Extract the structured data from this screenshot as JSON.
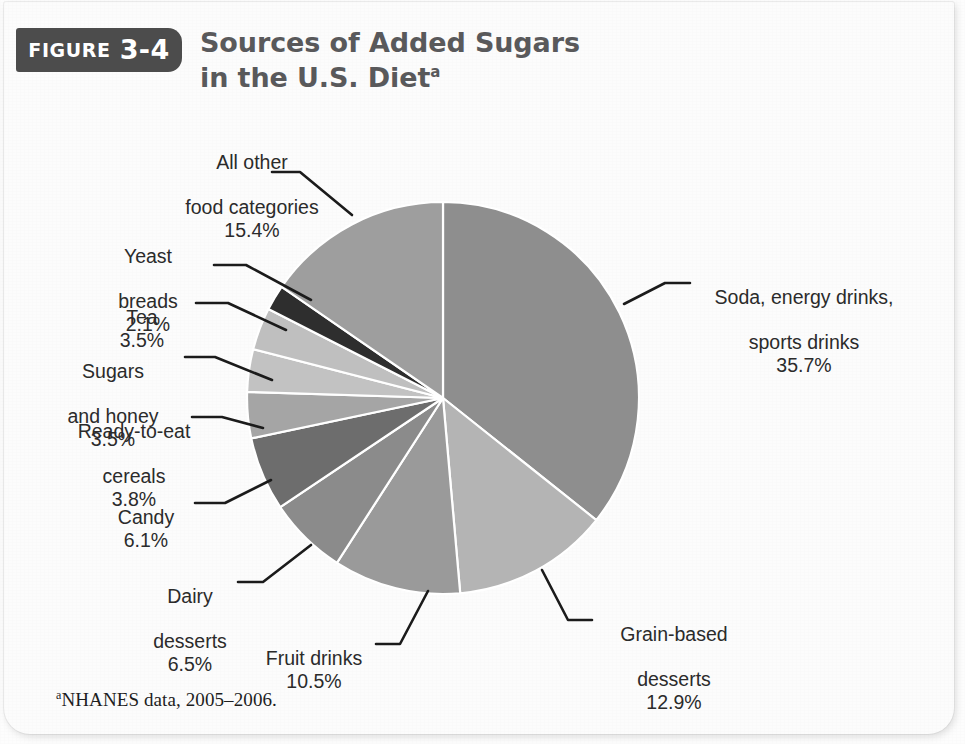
{
  "figure": {
    "badge_word": "FIGURE",
    "badge_number": "3-4",
    "title_line1": "Sources of Added Sugars",
    "title_line2": "in the U.S. Diet",
    "title_superscript": "a",
    "footnote_superscript": "a",
    "footnote_text": "NHANES data, 2005–2006."
  },
  "colors": {
    "badge_background": "#4c4c4c",
    "title_text": "#59595b",
    "label_text": "#2b2b2b",
    "leader_line": "#1b1b1b",
    "slice_border": "#ffffff",
    "page_background": "#fcfcfc"
  },
  "chart_data": {
    "type": "pie",
    "title": "Sources of Added Sugars in the U.S. Diet",
    "subtitle": "",
    "xlabel": "",
    "ylabel": "",
    "units": "percent",
    "start_angle_deg": 0,
    "direction": "clockwise",
    "legend_position": "callout-labels",
    "grid": false,
    "total": 100.0,
    "footnote": "NHANES data, 2005–2006.",
    "categories": [
      "Soda, energy drinks, sports drinks",
      "Grain-based desserts",
      "Fruit drinks",
      "Dairy desserts",
      "Candy",
      "Ready-to-eat cereals",
      "Sugars and honey",
      "Tea",
      "Yeast breads",
      "All other food categories"
    ],
    "values": [
      35.7,
      12.9,
      10.5,
      6.5,
      6.1,
      3.8,
      3.5,
      3.5,
      2.1,
      15.4
    ],
    "slices": [
      {
        "id": "soda",
        "label_line1": "Soda, energy drinks,",
        "label_line2": "sports drinks",
        "label_line3": "",
        "value": 35.7,
        "pct_text": "35.7%",
        "color": "#8e8e8e"
      },
      {
        "id": "grain",
        "label_line1": "Grain-based",
        "label_line2": "desserts",
        "label_line3": "",
        "value": 12.9,
        "pct_text": "12.9%",
        "color": "#b4b4b4"
      },
      {
        "id": "fruit",
        "label_line1": "Fruit drinks",
        "label_line2": "",
        "label_line3": "",
        "value": 10.5,
        "pct_text": "10.5%",
        "color": "#9a9a9a"
      },
      {
        "id": "dairy",
        "label_line1": "Dairy",
        "label_line2": "desserts",
        "label_line3": "",
        "value": 6.5,
        "pct_text": "6.5%",
        "color": "#8b8b8b"
      },
      {
        "id": "candy",
        "label_line1": "Candy",
        "label_line2": "",
        "label_line3": "",
        "value": 6.1,
        "pct_text": "6.1%",
        "color": "#6d6d6d"
      },
      {
        "id": "cereals",
        "label_line1": "Ready-to-eat",
        "label_line2": "cereals",
        "label_line3": "",
        "value": 3.8,
        "pct_text": "3.8%",
        "color": "#a5a5a5"
      },
      {
        "id": "sugars",
        "label_line1": "Sugars",
        "label_line2": "and honey",
        "label_line3": "",
        "value": 3.5,
        "pct_text": "3.5%",
        "color": "#c2c2c2"
      },
      {
        "id": "tea",
        "label_line1": "Tea",
        "label_line2": "",
        "label_line3": "",
        "value": 3.5,
        "pct_text": "3.5%",
        "color": "#bfbfbf"
      },
      {
        "id": "yeast",
        "label_line1": "Yeast",
        "label_line2": "breads",
        "label_line3": "",
        "value": 2.1,
        "pct_text": "2.1%",
        "color": "#2e2e2e"
      },
      {
        "id": "allother",
        "label_line1": "All other",
        "label_line2": "food categories",
        "label_line3": "",
        "value": 15.4,
        "pct_text": "15.4%",
        "color": "#9e9e9e"
      }
    ]
  }
}
